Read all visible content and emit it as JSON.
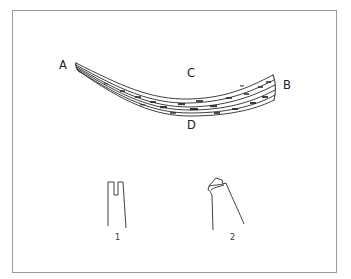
{
  "figure": {
    "main_drawing": {
      "description": "curved fibre bundle",
      "labels": {
        "a": "A",
        "b": "B",
        "c": "C",
        "d": "D"
      },
      "strand_count": 6,
      "stroke_color": "#2a2a2a"
    },
    "details": [
      {
        "number": "1",
        "description": "notched strand tip"
      },
      {
        "number": "2",
        "description": "angled cut strand tip"
      }
    ],
    "frame_color": "#9a9a9a"
  }
}
